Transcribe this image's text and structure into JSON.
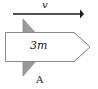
{
  "figure": {
    "width": 98,
    "height": 89,
    "background_color": "#ffffff"
  },
  "velocity_arrow": {
    "label": "v",
    "color": "#1a1a1a",
    "x_start": 13,
    "x_end": 84,
    "y": 14
  },
  "block": {
    "label": "3m",
    "fill_color": "#ffffff",
    "stroke_color": "#8c8c8c"
  },
  "wedge": {
    "label": "A",
    "fill_color": "#9a9a9a",
    "stroke_color": "#8c8c8c"
  },
  "icons": {
    "arrow_right": "arrow-right-icon"
  }
}
